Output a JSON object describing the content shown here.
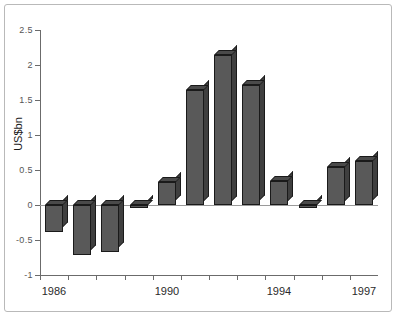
{
  "chart_data": {
    "type": "bar",
    "title": "",
    "xlabel": "",
    "ylabel": "US$bn",
    "ylim": [
      -1,
      2.5
    ],
    "ytick_labels": [
      "2.5",
      "2",
      "1.5",
      "1",
      "0.5",
      "0",
      "-0.5",
      "-1"
    ],
    "ytick_values": [
      2.5,
      2,
      1.5,
      1,
      0.5,
      0,
      -0.5,
      -1
    ],
    "grid": false,
    "legend": null,
    "categories": [
      "1986",
      "1987",
      "1988",
      "1989",
      "1990",
      "1991",
      "1992",
      "1993",
      "1994",
      "1995",
      "1996",
      "1997"
    ],
    "xtick_labels_shown": [
      "1986",
      "1990",
      "1994",
      "1997"
    ],
    "values": [
      -0.38,
      -0.72,
      -0.67,
      -0.04,
      0.33,
      1.65,
      2.15,
      1.72,
      0.35,
      -0.04,
      0.55,
      0.63
    ],
    "bar_style": "3d-extruded",
    "colors": {
      "bar_front": "#595959",
      "bar_side": "#3f3f3f",
      "bar_top": "#4a4a4a",
      "bar_outline": "#1a1a1a",
      "axis": "#6b6b6b",
      "zero_line": "#9a9a9a",
      "frame_border": "#b9b9b9",
      "background": "#ffffff",
      "tick_text": "#555555",
      "category_text": "#2a2a2a"
    }
  }
}
